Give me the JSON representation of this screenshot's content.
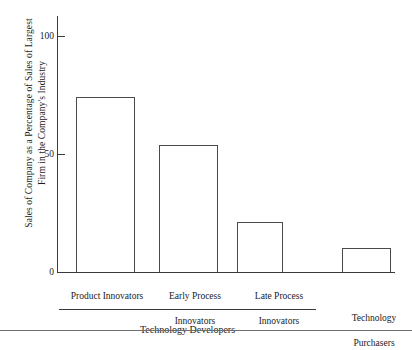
{
  "chart_data": {
    "type": "bar",
    "title": "",
    "subtitle": "",
    "xlabel": "",
    "ylabel": "Sales of Company as a Percentage of Sales of Largest Firm in the Company's Industry",
    "ylabel_lines": [
      "Sales of Company as a Percentage of Sales of Largest",
      "Firm in the Company's Industry"
    ],
    "categories": [
      "Product Innovators",
      "Early Process Innovators",
      "Late Process Innovators",
      "Technology Purchasers"
    ],
    "category_lines": [
      [
        "Product Innovators"
      ],
      [
        "Early Process",
        "Innovators"
      ],
      [
        "Late Process",
        "Innovators"
      ],
      [
        "Technology",
        "Purchasers"
      ]
    ],
    "values": [
      74,
      54,
      21,
      10
    ],
    "ylim": [
      0,
      110
    ],
    "yticks": [
      0,
      50,
      100
    ],
    "ytick_labels": [
      "0",
      "50",
      "100"
    ],
    "grid": false,
    "legend": "none",
    "bar_fill": "#ffffff",
    "bar_edge_color": "#4a4a4a",
    "axis_color": "#3a3a3a",
    "groups": [
      {
        "label": "Technology Developers",
        "members": [
          0,
          1,
          2
        ]
      },
      {
        "label": "Technology Purchasers",
        "members": [
          3
        ]
      }
    ]
  },
  "axis": {
    "ticks": [
      {
        "label": "100",
        "value": 100
      },
      {
        "label": "50",
        "value": 50
      },
      {
        "label": "0",
        "value": 0
      }
    ]
  },
  "categories": [
    {
      "line1": "Product Innovators",
      "line2": ""
    },
    {
      "line1": "Early Process",
      "line2": "Innovators"
    },
    {
      "line1": "Late Process",
      "line2": "Innovators"
    },
    {
      "line1": "Technology",
      "line2": "Purchasers"
    }
  ],
  "groups": [
    {
      "label": "Technology Developers"
    }
  ],
  "ylabel": {
    "line1": "Sales of Company as a Percentage of Sales of Largest",
    "line2": "Firm in the Company's Industry"
  }
}
